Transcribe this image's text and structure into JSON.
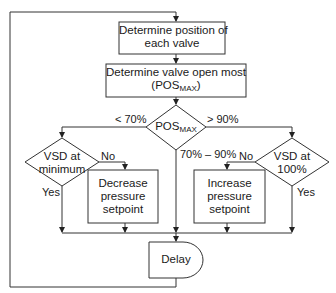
{
  "diagram": {
    "type": "flowchart",
    "nodes": {
      "determine_position": {
        "shape": "process",
        "line1": "Determine position of",
        "line2": "each valve"
      },
      "determine_open_most": {
        "shape": "process",
        "line1": "Determine valve open most",
        "line2_prefix": "(POS",
        "line2_sub": "MAX",
        "line2_suffix": ")"
      },
      "pos_max_decision": {
        "shape": "decision",
        "text": "POS",
        "sub": "MAX"
      },
      "vsd_minimum": {
        "shape": "decision",
        "line1": "VSD at",
        "line2": "minimum"
      },
      "decrease_setpoint": {
        "shape": "process",
        "line1": "Decrease",
        "line2": "pressure",
        "line3": "setpoint"
      },
      "increase_setpoint": {
        "shape": "process",
        "line1": "Increase",
        "line2": "pressure",
        "line3": "setpoint"
      },
      "vsd_100": {
        "shape": "decision",
        "line1": "VSD at",
        "line2": "100%"
      },
      "delay": {
        "shape": "delay",
        "text": "Delay"
      }
    },
    "edges": {
      "lt70": "< 70%",
      "gt90": "> 90%",
      "mid": "70% – 90%",
      "left_no": "No",
      "left_yes": "Yes",
      "right_no": "No",
      "right_yes": "Yes"
    },
    "colors": {
      "stroke": "#333333",
      "background": "#ffffff",
      "text": "#1a1a1a"
    }
  }
}
